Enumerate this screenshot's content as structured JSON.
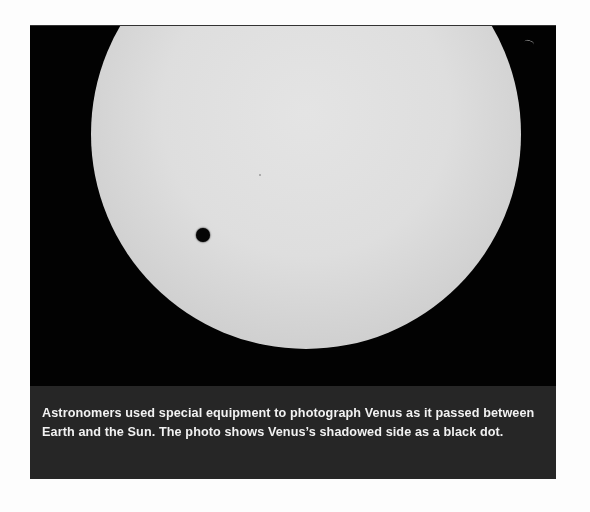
{
  "figure": {
    "caption": "Astronomers used special equipment to photograph Venus as it passed between Earth and the Sun. The photo shows Venus’s shadowed side as a black dot.",
    "colors": {
      "background": "#020202",
      "sun": "#dedede",
      "venus": "#050505",
      "caption_box": "#262626",
      "caption_text": "#f2f2f2"
    }
  }
}
